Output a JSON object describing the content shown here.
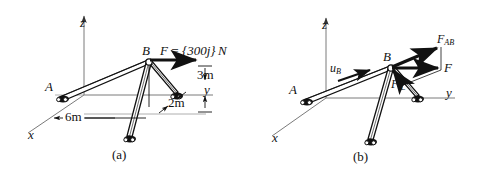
{
  "figure": {
    "panels": [
      {
        "caption": "(a)",
        "axes": {
          "x": "x",
          "y": "y",
          "z": "z"
        },
        "points": {
          "a": "A",
          "b": "B"
        },
        "force_label_prefix": "F",
        "force_label_equals": "=",
        "force_label_value": "{300j}",
        "force_label_unit": "N",
        "dimensions": [
          {
            "name": "height-3m",
            "text": "3m"
          },
          {
            "name": "offset-2m",
            "text": "2m"
          },
          {
            "name": "span-6m",
            "text": "6m"
          }
        ]
      },
      {
        "caption": "(b)",
        "axes": {
          "x": "x",
          "y": "y",
          "z": "z"
        },
        "points": {
          "a": "A",
          "b": "B"
        },
        "vectors": [
          {
            "name": "unit-vector-uB",
            "base": "u",
            "sub": "B"
          },
          {
            "name": "force-component-FAB",
            "base": "F",
            "sub": "AB"
          },
          {
            "name": "force-F",
            "base": "F",
            "sub": ""
          },
          {
            "name": "force-perpendicular",
            "base": "F",
            "sub": "⊥"
          }
        ]
      }
    ],
    "colors": {
      "ink": "#111111",
      "member_fill": "#ffffff",
      "axis_line": "#6f6f6f",
      "dimension_line": "#8a8a8a"
    }
  }
}
